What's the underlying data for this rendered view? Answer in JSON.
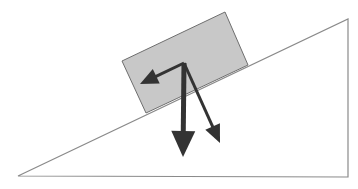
{
  "diagram": {
    "colors": {
      "background": "#ffffff",
      "incline_stroke": "#8a8a8a",
      "block_fill": "#c8c8c8",
      "block_stroke": "#6e6e6e",
      "arrow": "#333333"
    },
    "incline": {
      "points": [
        [
          18,
          176
        ],
        [
          348,
          19
        ],
        [
          348,
          177
        ]
      ]
    },
    "block": {
      "points": [
        [
          122,
          61
        ],
        [
          225,
          12
        ],
        [
          248,
          65
        ],
        [
          146,
          113
        ]
      ]
    },
    "arrows": [
      {
        "name": "gravity",
        "from": [
          184,
          63
        ],
        "to": [
          183,
          157
        ],
        "width": 5,
        "head_w": 24,
        "head_l": 26
      },
      {
        "name": "normal-component",
        "from": [
          184,
          63
        ],
        "to": [
          220,
          143
        ],
        "width": 3,
        "head_w": 16,
        "head_l": 18
      },
      {
        "name": "parallel-component",
        "from": [
          184,
          63
        ],
        "to": [
          140,
          84
        ],
        "width": 3,
        "head_w": 16,
        "head_l": 18
      }
    ]
  }
}
